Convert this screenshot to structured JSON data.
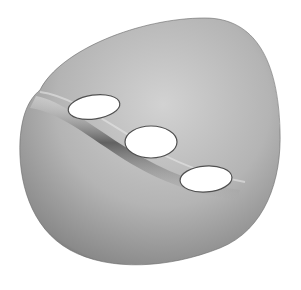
{
  "figure": {
    "hole_count": 3,
    "background_color": "#ffffff",
    "surface_color": "#a8a8a8"
  }
}
